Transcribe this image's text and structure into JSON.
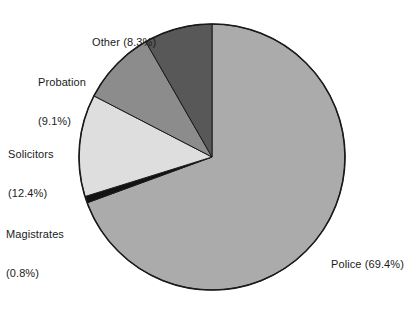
{
  "chart_data": {
    "type": "pie",
    "title": "",
    "subtitle": "",
    "xlabel": "",
    "ylabel": "",
    "legend_position": "none",
    "grid": false,
    "units": "percent",
    "start_angle_deg": 0,
    "direction": "clockwise",
    "categories": [
      "Police",
      "Magistrates",
      "Solicitors",
      "Probation",
      "Other"
    ],
    "values": [
      69.4,
      0.8,
      12.4,
      9.1,
      8.3
    ],
    "slices": [
      {
        "name": "Police",
        "value": 69.4,
        "label": "Police (69.4%)",
        "label_line1": "Police (69.4%)",
        "label_line2": "",
        "color": "#ababab",
        "order": 1
      },
      {
        "name": "Magistrates",
        "value": 0.8,
        "label": "Magistrates (0.8%)",
        "label_line1": "Magistrates",
        "label_line2": "(0.8%)",
        "color": "#121212",
        "order": 2
      },
      {
        "name": "Solicitors",
        "value": 12.4,
        "label": "Solicitors (12.4%)",
        "label_line1": "Solicitors",
        "label_line2": "(12.4%)",
        "color": "#dedede",
        "order": 3
      },
      {
        "name": "Probation",
        "value": 9.1,
        "label": "Probation (9.1%)",
        "label_line1": "Probation",
        "label_line2": "(9.1%)",
        "color": "#8c8c8c",
        "order": 4
      },
      {
        "name": "Other",
        "value": 8.3,
        "label": "Other (8.3%)",
        "label_line1": "Other (8.3%)",
        "label_line2": "",
        "color": "#585858",
        "order": 5
      }
    ],
    "geometry": {
      "center_x": 212,
      "center_y": 157,
      "radius": 133,
      "outline_color": "#1a1a1a",
      "outline_width": 1.6
    },
    "background_color": "#ffffff",
    "text_color": "#1b1b1b"
  }
}
